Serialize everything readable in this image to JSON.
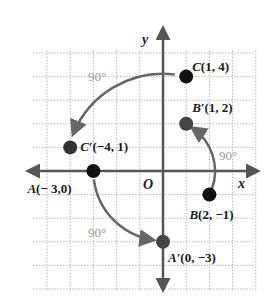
{
  "diagram": {
    "type": "coordinate-plane-rotation",
    "grid": {
      "x_min": -6,
      "x_max": 4,
      "y_min": -5,
      "y_max": 6,
      "origin_px": [
        163,
        171
      ],
      "unit_px": [
        23.2,
        23.6
      ],
      "line_color": "#b8b8b8"
    },
    "axes": {
      "color": "#555555",
      "x_label": "x",
      "y_label": "y",
      "origin_label": "O"
    },
    "points": [
      {
        "id": "C",
        "name": "C",
        "prime": false,
        "x": 1,
        "y": 4,
        "label": "C(1, 4)",
        "color": "#111111",
        "label_dx": 6,
        "label_dy": -6
      },
      {
        "id": "Cp",
        "name": "C′",
        "prime": true,
        "x": -4,
        "y": 1,
        "label": "C′(−4, 1)",
        "color": "#333333",
        "label_dx": 10,
        "label_dy": 4
      },
      {
        "id": "Bp",
        "name": "B′",
        "prime": true,
        "x": 1,
        "y": 2,
        "label": "B′(1, 2)",
        "color": "#444444",
        "label_dx": 6,
        "label_dy": -12
      },
      {
        "id": "B",
        "name": "B",
        "prime": false,
        "x": 2,
        "y": -1,
        "label": "B(2, −1)",
        "color": "#111111",
        "label_dx": -20,
        "label_dy": 24
      },
      {
        "id": "A",
        "name": "A",
        "prime": false,
        "x": -3,
        "y": 0,
        "label": "A(− 3,0)",
        "color": "#111111",
        "label_dx": -66,
        "label_dy": 22
      },
      {
        "id": "Ap",
        "name": "A′",
        "prime": true,
        "x": 0,
        "y": -3,
        "label": "A′(0, −3)",
        "color": "#444444",
        "label_dx": 5,
        "label_dy": 20
      }
    ],
    "rotations": [
      {
        "from": "C",
        "to": "Cp",
        "angle_label": "90°",
        "label_pos": [
          88,
          81
        ]
      },
      {
        "from": "B",
        "to": "Bp",
        "angle_label": "90°",
        "label_pos": [
          219,
          160
        ]
      },
      {
        "from": "A",
        "to": "Ap",
        "angle_label": "90°",
        "label_pos": [
          88,
          237
        ]
      }
    ],
    "arc_color": "#666666",
    "label_color": "#999999"
  }
}
